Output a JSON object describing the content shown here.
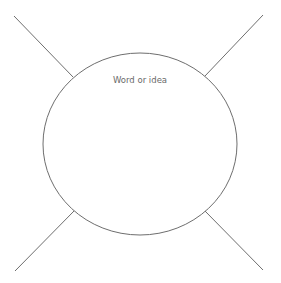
{
  "diagram": {
    "type": "spider-map",
    "center_label": "Word or idea",
    "colors": {
      "stroke": "#6e6e6e",
      "text": "#6a6a6a",
      "background": "#ffffff"
    },
    "ellipse": {
      "cx": 140,
      "cy": 144,
      "rx": 97,
      "ry": 91
    },
    "legs": [
      {
        "name": "top-left",
        "x1": 14,
        "y1": 16,
        "x2": 73,
        "y2": 77
      },
      {
        "name": "top-right",
        "x1": 263,
        "y1": 15,
        "x2": 205,
        "y2": 76
      },
      {
        "name": "bottom-left",
        "x1": 74,
        "y1": 211,
        "x2": 15,
        "y2": 271
      },
      {
        "name": "bottom-right",
        "x1": 205,
        "y1": 211,
        "x2": 263,
        "y2": 270
      }
    ]
  }
}
